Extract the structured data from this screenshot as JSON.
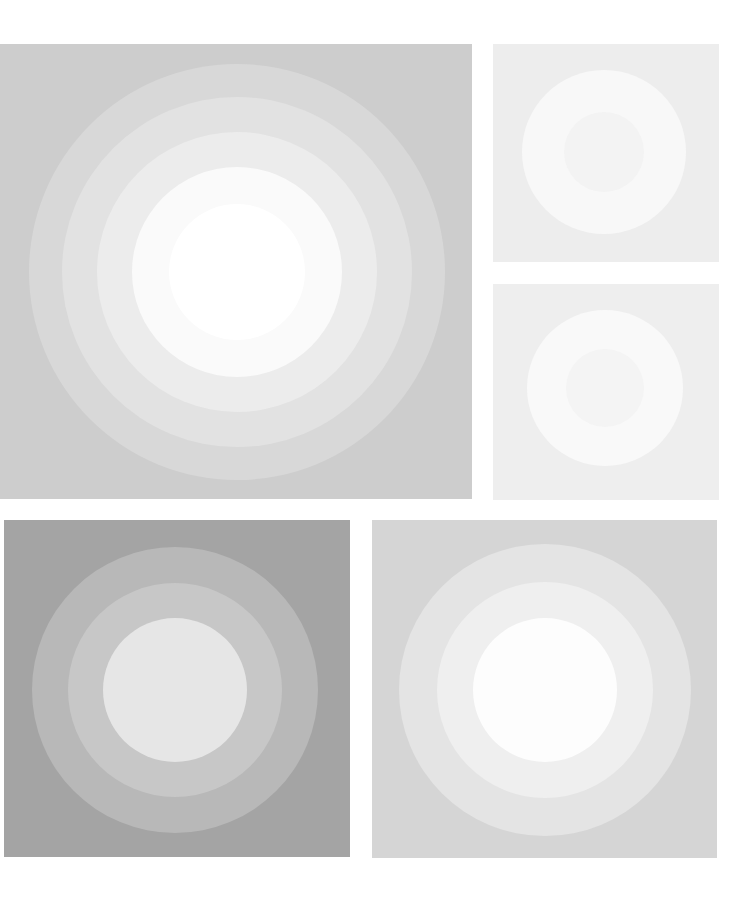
{
  "artwork": {
    "panels": [
      {
        "name": "panel-large-top-left",
        "x": 0,
        "y": 44,
        "w": 472,
        "h": 455,
        "bg": "#cdcdcd",
        "cx": 237,
        "cy": 228,
        "rings": [
          {
            "r": 208,
            "color": "#d8d8d8"
          },
          {
            "r": 175,
            "color": "#e2e2e2"
          },
          {
            "r": 140,
            "color": "#ececec"
          },
          {
            "r": 105,
            "color": "#fafafa"
          },
          {
            "r": 68,
            "color": "#ffffff"
          }
        ]
      },
      {
        "name": "panel-small-top-right",
        "x": 493,
        "y": 44,
        "w": 226,
        "h": 218,
        "bg": "#ededed",
        "cx": 111,
        "cy": 108,
        "rings": [
          {
            "r": 82,
            "color": "#f8f8f8"
          },
          {
            "r": 40,
            "color": "#f3f3f3"
          }
        ]
      },
      {
        "name": "panel-small-middle-right",
        "x": 493,
        "y": 284,
        "w": 226,
        "h": 216,
        "bg": "#eeeeee",
        "cx": 112,
        "cy": 104,
        "rings": [
          {
            "r": 78,
            "color": "#f9f9f9"
          },
          {
            "r": 39,
            "color": "#f4f4f4"
          }
        ]
      },
      {
        "name": "panel-dark-bottom-left",
        "x": 4,
        "y": 520,
        "w": 346,
        "h": 337,
        "bg": "#a4a4a4",
        "cx": 171,
        "cy": 170,
        "rings": [
          {
            "r": 143,
            "color": "#b8b8b8"
          },
          {
            "r": 107,
            "color": "#c7c7c7"
          },
          {
            "r": 72,
            "color": "#e6e6e6"
          }
        ]
      },
      {
        "name": "panel-light-bottom-right",
        "x": 372,
        "y": 520,
        "w": 345,
        "h": 338,
        "bg": "#d5d5d5",
        "cx": 173,
        "cy": 170,
        "rings": [
          {
            "r": 146,
            "color": "#e4e4e4"
          },
          {
            "r": 108,
            "color": "#efefef"
          },
          {
            "r": 72,
            "color": "#fdfdfd"
          }
        ]
      }
    ]
  }
}
